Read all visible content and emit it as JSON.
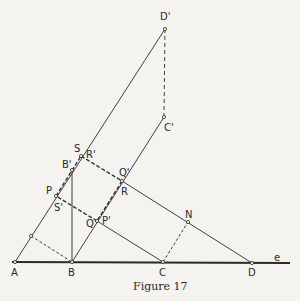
{
  "caption": "Figure 17",
  "colors": {
    "ink": "#2a2a2a",
    "background": "#f4f3f0"
  },
  "points": {
    "A": {
      "label": "A",
      "x": 15,
      "y": 262
    },
    "B": {
      "label": "B",
      "x": 72,
      "y": 262
    },
    "C": {
      "label": "C",
      "x": 163,
      "y": 262
    },
    "D": {
      "label": "D",
      "x": 252,
      "y": 263
    },
    "Dp": {
      "label": "D'",
      "x": 165,
      "y": 29
    },
    "Cp": {
      "label": "C'",
      "x": 164,
      "y": 117
    },
    "S": {
      "label": "S",
      "x": 81,
      "y": 156
    },
    "Rp": {
      "label": "R'",
      "x": 81,
      "y": 156
    },
    "Bp": {
      "label": "B'",
      "x": 72,
      "y": 170
    },
    "Qp": {
      "label": "Q'",
      "x": 122,
      "y": 181
    },
    "R": {
      "label": "R",
      "x": 122,
      "y": 181
    },
    "P": {
      "label": "P",
      "x": 56,
      "y": 196
    },
    "Sp": {
      "label": "S'",
      "x": 56,
      "y": 196
    },
    "Q": {
      "label": "Q",
      "x": 97,
      "y": 221
    },
    "Pp": {
      "label": "P'",
      "x": 97,
      "y": 221
    },
    "N": {
      "label": "N",
      "x": 188,
      "y": 222
    },
    "e": {
      "label": "e",
      "x": 276,
      "y": 259
    }
  }
}
